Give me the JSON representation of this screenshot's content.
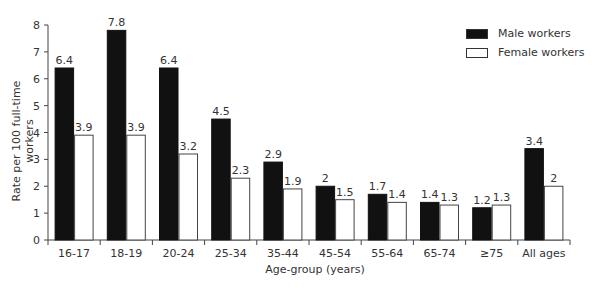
{
  "chart_data": {
    "type": "bar",
    "title": "",
    "xlabel": "Age-group (years)",
    "ylabel": "Rate per 100 full-time workers",
    "ylim": [
      0,
      8
    ],
    "yticks": [
      0,
      1,
      2,
      3,
      4,
      5,
      6,
      7,
      8
    ],
    "grid": false,
    "legend_position": "top-right",
    "categories": [
      "16-17",
      "18-19",
      "20-24",
      "25-34",
      "35-44",
      "45-54",
      "55-64",
      "65-74",
      "≥75",
      "All ages"
    ],
    "series": [
      {
        "name": "Male workers",
        "color": "#111111",
        "values": [
          6.4,
          7.8,
          6.4,
          4.5,
          2.9,
          2,
          1.7,
          1.4,
          1.2,
          3.4
        ],
        "labels": [
          "6.4",
          "7.8",
          "6.4",
          "4.5",
          "2.9",
          "2",
          "1.7",
          "1.4",
          "1.2",
          "3.4"
        ]
      },
      {
        "name": "Female workers",
        "color": "#ffffff",
        "values": [
          3.9,
          3.9,
          3.2,
          2.3,
          1.9,
          1.5,
          1.4,
          1.3,
          1.3,
          2
        ],
        "labels": [
          "3.9",
          "3.9",
          "3.2",
          "2.3",
          "1.9",
          "1.5",
          "1.4",
          "1.3",
          "1.3",
          "2"
        ]
      }
    ]
  },
  "legend": {
    "male": "Male workers",
    "female": "Female workers"
  },
  "axes": {
    "xlabel": "Age-group (years)",
    "ylabel": "Rate per 100 full-time workers"
  }
}
